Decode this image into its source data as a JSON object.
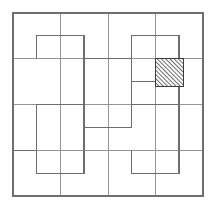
{
  "figure": {
    "background_color": "#ffffff",
    "canvas": {
      "width": 215,
      "height": 209
    }
  },
  "geometry": {
    "grid": {
      "columns": 4,
      "rows": 4,
      "cell_size": 47.5,
      "origin_x": 13,
      "origin_y": 13,
      "x_lines": [
        13,
        60.5,
        108,
        155.5,
        203
      ],
      "y_lines": [
        13,
        58.75,
        104.5,
        150.25,
        196
      ],
      "line_color": "#8a8a8a",
      "line_width": 0.9
    },
    "outer_border": {
      "x": 13,
      "y": 13,
      "width": 190,
      "height": 183,
      "color": "#6e6e6e",
      "line_width": 1.1
    },
    "tiles": [
      {
        "id": "tile-top-left",
        "shape": "L-tromino",
        "points": "60.5,58.75 60.5,13 155.5,13 155.5,58.75 108,58.75 108,104.5 60.5,104.5",
        "note": "upper-left pinwheel arm"
      },
      {
        "id": "tile-top-right",
        "shape": "L-tromino",
        "points": "155.5,13 203,13 203,104.5 108,104.5 108,58.75 155.5,58.75",
        "note": "upper-right pinwheel arm"
      },
      {
        "id": "tile-bottom-right",
        "shape": "L-tromino",
        "points": "108,104.5 203,104.5 203,196 108,196 108,150.25 155.5,150.25",
        "note": "lower-right pinwheel arm"
      },
      {
        "id": "tile-bottom-left",
        "shape": "L-tromino",
        "points": "13,104.5 60.5,104.5 60.5,150.25 108,150.25 108,196 13,196",
        "note": "lower-left pinwheel arm"
      },
      {
        "id": "tile-inner-square-left",
        "shape": "square",
        "points": "13,13 60.5,13 60.5,104.5 13,104.5",
        "note": "left column strip"
      }
    ],
    "inner_outlines": [
      {
        "id": "outline-tl",
        "points": "36.5,36.5 36.5,81.5 84,81.5 84,127.25 131.5,127.25 131.5,81.5 84,81.5 84,36.5",
        "note": "interior L outline upper-left"
      }
    ],
    "shaded_cell": {
      "id": "hatched-cell",
      "x": 155.5,
      "y": 58.75,
      "width": 28,
      "height": 28,
      "fill_pattern": "diagonal-hatch-45",
      "hatch_color": "#4a4a4a",
      "hatch_spacing": 3,
      "border_color": "#3c3c3c",
      "border_width": 1.2,
      "grid_position": {
        "column": 4,
        "row": 2
      },
      "label": "marked square"
    }
  },
  "annotations": {
    "has_text_labels": false,
    "caption": ""
  }
}
